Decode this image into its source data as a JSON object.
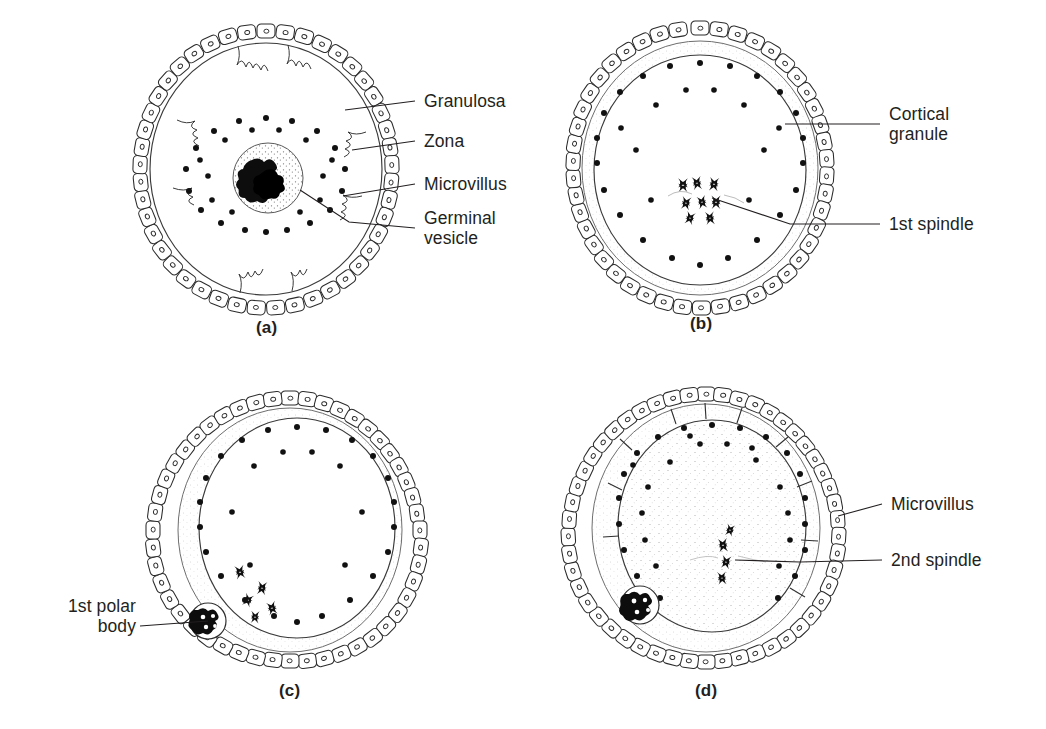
{
  "figure": {
    "background_color": "#ffffff",
    "ink_color": "#231f20",
    "panels": [
      {
        "id": "a",
        "caption": "(a)",
        "stage_name": "Germinal vesicle stage oocyte",
        "labels": [
          {
            "key": "granulosa",
            "text": "Granulosa"
          },
          {
            "key": "zona",
            "text": "Zona"
          },
          {
            "key": "microvillus",
            "text": "Microvillus"
          },
          {
            "key": "germinal_vesicle",
            "text": "Germinal\nvesicle"
          }
        ],
        "features": {
          "granulosa_cell_count": 44,
          "cortical_granule_count": 30,
          "has_germinal_vesicle": true,
          "has_polar_body": false,
          "spindle": "none",
          "chromatin": "condensed mass inside germinal vesicle"
        }
      },
      {
        "id": "b",
        "caption": "(b)",
        "stage_name": "Metaphase I oocyte",
        "labels": [
          {
            "key": "cortical_granule",
            "text": "Cortical\ngranule"
          },
          {
            "key": "first_spindle",
            "text": "1st spindle"
          }
        ],
        "features": {
          "granulosa_cell_count": 46,
          "cortical_granule_count": 32,
          "has_germinal_vesicle": false,
          "has_polar_body": false,
          "spindle": "1st spindle",
          "chromatin": "chromosomes on first meiotic spindle"
        }
      },
      {
        "id": "c",
        "caption": "(c)",
        "stage_name": "First polar body extrusion",
        "labels": [
          {
            "key": "first_polar_body",
            "text": "1st polar\nbody"
          }
        ],
        "features": {
          "granulosa_cell_count": 48,
          "cortical_granule_count": 30,
          "has_germinal_vesicle": false,
          "has_polar_body": true,
          "spindle": "telophase I chromosomes",
          "chromatin": "separating chromosome groups"
        }
      },
      {
        "id": "d",
        "caption": "(d)",
        "stage_name": "Metaphase II oocyte",
        "labels": [
          {
            "key": "microvillus",
            "text": "Microvillus"
          },
          {
            "key": "second_spindle",
            "text": "2nd spindle"
          }
        ],
        "features": {
          "granulosa_cell_count": 50,
          "cortical_granule_count": 34,
          "has_germinal_vesicle": false,
          "has_polar_body": true,
          "spindle": "2nd spindle",
          "chromatin": "chromosomes on second meiotic spindle"
        }
      }
    ]
  }
}
